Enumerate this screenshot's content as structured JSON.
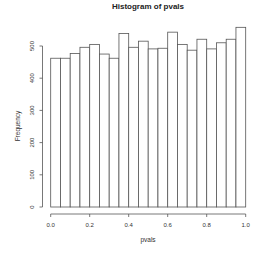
{
  "chart_data": {
    "type": "bar",
    "subtype": "histogram",
    "title": "Histogram of pvals",
    "xlabel": "pvals",
    "ylabel": "Frequency",
    "bin_edges": [
      0.0,
      0.05,
      0.1,
      0.15,
      0.2,
      0.25,
      0.3,
      0.35,
      0.4,
      0.45,
      0.5,
      0.55,
      0.6,
      0.65,
      0.7,
      0.75,
      0.8,
      0.85,
      0.9,
      0.95,
      1.0
    ],
    "values": [
      462,
      462,
      477,
      496,
      505,
      475,
      462,
      539,
      496,
      515,
      491,
      493,
      543,
      505,
      487,
      521,
      491,
      510,
      521,
      558
    ],
    "xlim": [
      0.0,
      1.0
    ],
    "ylim": [
      0,
      560
    ],
    "x_ticks": [
      0.0,
      0.2,
      0.4,
      0.6,
      0.8,
      1.0
    ],
    "x_tick_labels": [
      "0.0",
      "0.2",
      "0.4",
      "0.6",
      "0.8",
      "1.0"
    ],
    "y_ticks": [
      0,
      100,
      200,
      300,
      400,
      500
    ],
    "y_tick_labels": [
      "0",
      "100",
      "200",
      "300",
      "400",
      "500"
    ],
    "grid": false,
    "legend": null,
    "bar_fill": "#ffffff",
    "bar_stroke": "#555555"
  }
}
